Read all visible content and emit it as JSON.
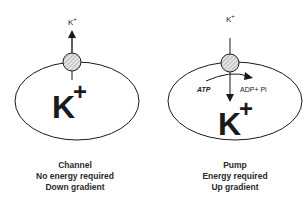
{
  "diagram": {
    "colors": {
      "line": "#1a1a1a",
      "hatch": "#9a9a9a",
      "background": "#ffffff"
    },
    "channel": {
      "ion_outside_label": "K",
      "ion_outside_charge": "+",
      "ion_inside_label": "K",
      "ion_inside_charge": "+",
      "arrow_direction": "out",
      "caption": {
        "line1": "Channel",
        "line2": "No energy required",
        "line3": "Down gradient"
      }
    },
    "pump": {
      "ion_outside_label": "K",
      "ion_outside_charge": "+",
      "ion_inside_label": "K",
      "ion_inside_charge": "+",
      "arrow_direction": "in",
      "energy_input_label": "ATP",
      "energy_output_label": "ADP+ Pi",
      "caption": {
        "line1": "Pump",
        "line2": "Energy required",
        "line3": "Up gradient"
      }
    }
  }
}
